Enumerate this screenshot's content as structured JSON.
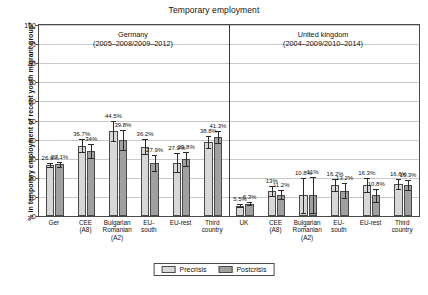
{
  "chart_data": {
    "type": "bar",
    "title": "Temporary employment",
    "xlabel": "",
    "ylabel": "% in temporary employment of recent youth migrant group*",
    "ylim": [
      0,
      100
    ],
    "yticks": [
      0,
      10,
      20,
      30,
      40,
      50,
      60,
      70,
      80,
      90,
      100
    ],
    "grid": true,
    "legend_position": "bottom",
    "legend": [
      "Precrisis",
      "Postcrisis"
    ],
    "panels": [
      {
        "name": "Germany",
        "years": "(2005–2008/2009–2012)",
        "categories": [
          "Ger",
          "CEE (A8)",
          "Bulgarian Romanian (A2)",
          "EU-south",
          "EU-rest",
          "Third country"
        ],
        "category_lines": [
          [
            "Ger"
          ],
          [
            "CEE",
            "(A8)"
          ],
          [
            "Bulgarian",
            "Romanian",
            "(A2)"
          ],
          [
            "EU-",
            "south"
          ],
          [
            "EU-rest"
          ],
          [
            "Third",
            "country"
          ]
        ],
        "series": [
          {
            "name": "Precrisis",
            "values": [
              26.6,
              36.7,
              44.5,
              36.2,
              27.9,
              38.8
            ],
            "labels": [
              "26.6%",
              "36.7%",
              "44.5%",
              "36.2%",
              "27.9%",
              "38.8%"
            ],
            "err_low": [
              1.2,
              3.4,
              5.0,
              4.0,
              5.0,
              3.0
            ],
            "err_high": [
              1.2,
              3.4,
              5.0,
              4.0,
              5.0,
              3.0
            ]
          },
          {
            "name": "Postcrisis",
            "values": [
              27.1,
              34.0,
              39.8,
              27.9,
              29.8,
              41.3
            ],
            "labels": [
              "27.1%",
              "34%",
              "39.8%",
              "27.9%",
              "29.8%",
              "41.3%"
            ],
            "err_low": [
              1.2,
              3.6,
              5.2,
              4.2,
              3.6,
              3.0
            ],
            "err_high": [
              1.2,
              3.6,
              5.2,
              4.2,
              3.6,
              3.0
            ]
          }
        ]
      },
      {
        "name": "United kingdom",
        "years": "(2004–2009/2010–2014)",
        "categories": [
          "UK",
          "CEE (A8)",
          "Bulgarian Romanian (A2)",
          "EU-south",
          "EU-rest",
          "Third country"
        ],
        "category_lines": [
          [
            "UK"
          ],
          [
            "CEE",
            "(A8)"
          ],
          [
            "Bulgarian",
            "Romanian",
            "(A2)"
          ],
          [
            "EU-",
            "south"
          ],
          [
            "EU-rest"
          ],
          [
            "Third",
            "country"
          ]
        ],
        "series": [
          {
            "name": "Precrisis",
            "values": [
              5.5,
              13.0,
              10.8,
              16.2,
              16.3,
              16.6
            ],
            "labels": [
              "5.5%",
              "13%",
              "10.8%",
              "16.2%",
              "16.3%",
              "16.6%"
            ],
            "err_low": [
              0.7,
              2.6,
              9.0,
              3.2,
              3.8,
              2.6
            ],
            "err_high": [
              0.7,
              2.6,
              9.0,
              3.2,
              3.8,
              2.6
            ]
          },
          {
            "name": "Postcrisis",
            "values": [
              6.3,
              11.2,
              11.0,
              13.2,
              10.8,
              16.3
            ],
            "labels": [
              "6.3%",
              "11.2%",
              "11%",
              "13.2%",
              "10.8%",
              "16.3%"
            ],
            "err_low": [
              0.8,
              2.4,
              9.2,
              4.0,
              3.4,
              2.8
            ],
            "err_high": [
              0.8,
              2.4,
              9.2,
              4.0,
              3.4,
              2.8
            ]
          }
        ]
      }
    ]
  },
  "colors": {
    "precrisis": "#d8d8d8",
    "postcrisis": "#a0a0a0",
    "axis": "#4a4a4a",
    "grid": "#c9c9c9"
  }
}
